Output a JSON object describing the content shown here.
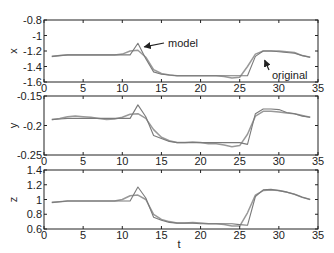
{
  "chart_data": [
    {
      "type": "line",
      "title": "",
      "xlabel": "",
      "ylabel": "x",
      "xlim": [
        0,
        35
      ],
      "ylim": [
        -1.6,
        -0.8
      ],
      "xticks": [
        0,
        5,
        10,
        15,
        20,
        25,
        30,
        35
      ],
      "yticks": [
        -0.8,
        -1,
        -1.2,
        -1.4,
        -1.6
      ],
      "ytick_labels": [
        "-0.8",
        "-1",
        "-1.2",
        "-1.4",
        "-1.6"
      ],
      "grid": false,
      "annotations": [
        {
          "text": "model",
          "arrow_to": [
            12.3,
            -1.12
          ],
          "text_pos": [
            16.5,
            -1.1
          ]
        },
        {
          "text": "original",
          "arrow_to": [
            27.8,
            -1.28
          ],
          "text_pos": [
            29.5,
            -1.52
          ]
        }
      ],
      "series": [
        {
          "name": "original",
          "x": [
            1,
            2,
            3,
            4,
            5,
            6,
            7,
            8,
            9,
            10,
            11,
            12,
            13,
            14,
            15,
            16,
            17,
            18,
            19,
            20,
            21,
            22,
            23,
            24,
            25,
            26,
            27,
            28,
            29,
            30,
            31,
            32,
            33,
            34
          ],
          "y": [
            -1.27,
            -1.26,
            -1.25,
            -1.25,
            -1.25,
            -1.25,
            -1.25,
            -1.25,
            -1.25,
            -1.24,
            -1.2,
            -1.19,
            -1.28,
            -1.44,
            -1.49,
            -1.51,
            -1.52,
            -1.52,
            -1.52,
            -1.52,
            -1.52,
            -1.52,
            -1.53,
            -1.55,
            -1.54,
            -1.4,
            -1.24,
            -1.2,
            -1.2,
            -1.2,
            -1.21,
            -1.22,
            -1.26,
            -1.28
          ]
        },
        {
          "name": "model",
          "x": [
            1,
            2,
            3,
            4,
            5,
            6,
            7,
            8,
            9,
            10,
            11,
            12,
            13,
            14,
            15,
            16,
            17,
            18,
            19,
            20,
            21,
            22,
            23,
            24,
            25,
            26,
            27,
            28,
            29,
            30,
            31,
            32,
            33,
            34
          ],
          "y": [
            -1.27,
            -1.26,
            -1.25,
            -1.25,
            -1.25,
            -1.25,
            -1.25,
            -1.25,
            -1.25,
            -1.25,
            -1.25,
            -1.1,
            -1.3,
            -1.47,
            -1.5,
            -1.51,
            -1.52,
            -1.52,
            -1.52,
            -1.52,
            -1.52,
            -1.52,
            -1.52,
            -1.52,
            -1.52,
            -1.52,
            -1.27,
            -1.2,
            -1.2,
            -1.21,
            -1.22,
            -1.23,
            -1.26,
            -1.28
          ]
        }
      ]
    },
    {
      "type": "line",
      "title": "",
      "xlabel": "",
      "ylabel": "y",
      "xlim": [
        0,
        35
      ],
      "ylim": [
        -0.25,
        -0.15
      ],
      "xticks": [
        0,
        5,
        10,
        15,
        20,
        25,
        30,
        35
      ],
      "yticks": [
        -0.15,
        -0.2,
        -0.25
      ],
      "ytick_labels": [
        "-0.15",
        "-0.2",
        "-0.25"
      ],
      "grid": false,
      "series": [
        {
          "name": "original",
          "x": [
            1,
            2,
            3,
            4,
            5,
            6,
            7,
            8,
            9,
            10,
            11,
            12,
            13,
            14,
            15,
            16,
            17,
            18,
            19,
            20,
            21,
            22,
            23,
            24,
            25,
            26,
            27,
            28,
            29,
            30,
            31,
            32,
            33,
            34
          ],
          "y": [
            -0.19,
            -0.188,
            -0.185,
            -0.184,
            -0.185,
            -0.186,
            -0.188,
            -0.19,
            -0.189,
            -0.186,
            -0.181,
            -0.18,
            -0.188,
            -0.207,
            -0.22,
            -0.226,
            -0.229,
            -0.229,
            -0.228,
            -0.229,
            -0.231,
            -0.231,
            -0.233,
            -0.236,
            -0.234,
            -0.215,
            -0.184,
            -0.176,
            -0.176,
            -0.177,
            -0.179,
            -0.18,
            -0.183,
            -0.186
          ]
        },
        {
          "name": "model",
          "x": [
            1,
            2,
            3,
            4,
            5,
            6,
            7,
            8,
            9,
            10,
            11,
            12,
            13,
            14,
            15,
            16,
            17,
            18,
            19,
            20,
            21,
            22,
            23,
            24,
            25,
            26,
            27,
            28,
            29,
            30,
            31,
            32,
            33,
            34
          ],
          "y": [
            -0.19,
            -0.189,
            -0.188,
            -0.188,
            -0.188,
            -0.188,
            -0.188,
            -0.188,
            -0.188,
            -0.188,
            -0.188,
            -0.165,
            -0.185,
            -0.217,
            -0.222,
            -0.227,
            -0.229,
            -0.229,
            -0.229,
            -0.229,
            -0.229,
            -0.229,
            -0.229,
            -0.229,
            -0.229,
            -0.232,
            -0.18,
            -0.172,
            -0.172,
            -0.173,
            -0.178,
            -0.18,
            -0.184,
            -0.186
          ]
        }
      ]
    },
    {
      "type": "line",
      "title": "",
      "xlabel": "t",
      "ylabel": "z",
      "xlim": [
        0,
        35
      ],
      "ylim": [
        0.6,
        1.4
      ],
      "xticks": [
        0,
        5,
        10,
        15,
        20,
        25,
        30,
        35
      ],
      "yticks": [
        1.4,
        1.2,
        1,
        0.8,
        0.6
      ],
      "ytick_labels": [
        "1.4",
        "1.2",
        "1",
        "0.8",
        "0.6"
      ],
      "grid": false,
      "series": [
        {
          "name": "original",
          "x": [
            1,
            2,
            3,
            4,
            5,
            6,
            7,
            8,
            9,
            10,
            11,
            12,
            13,
            14,
            15,
            16,
            17,
            18,
            19,
            20,
            21,
            22,
            23,
            24,
            25,
            26,
            27,
            28,
            29,
            30,
            31,
            32,
            33,
            34
          ],
          "y": [
            0.96,
            0.97,
            0.98,
            0.98,
            0.98,
            0.98,
            0.98,
            0.98,
            0.98,
            1.0,
            1.05,
            1.06,
            1.0,
            0.8,
            0.73,
            0.7,
            0.68,
            0.68,
            0.69,
            0.68,
            0.67,
            0.67,
            0.66,
            0.64,
            0.64,
            0.82,
            1.06,
            1.12,
            1.13,
            1.12,
            1.1,
            1.07,
            1.03,
            1.0
          ]
        },
        {
          "name": "model",
          "x": [
            1,
            2,
            3,
            4,
            5,
            6,
            7,
            8,
            9,
            10,
            11,
            12,
            13,
            14,
            15,
            16,
            17,
            18,
            19,
            20,
            21,
            22,
            23,
            24,
            25,
            26,
            27,
            28,
            29,
            30,
            31,
            32,
            33,
            34
          ],
          "y": [
            0.96,
            0.97,
            0.98,
            0.98,
            0.98,
            0.98,
            0.98,
            0.98,
            0.98,
            0.98,
            0.98,
            1.17,
            1.02,
            0.76,
            0.72,
            0.69,
            0.68,
            0.68,
            0.68,
            0.67,
            0.67,
            0.67,
            0.67,
            0.67,
            0.66,
            0.65,
            1.04,
            1.13,
            1.14,
            1.12,
            1.1,
            1.07,
            1.03,
            1.0
          ]
        }
      ]
    }
  ],
  "panels": [
    {
      "ylabel": "x"
    },
    {
      "ylabel": "y"
    },
    {
      "ylabel": "z",
      "xlabel": "t"
    }
  ],
  "labels": {
    "model": "model",
    "original": "original",
    "t": "t"
  },
  "colors": {
    "axes": "#222222",
    "original": "#999999",
    "model": "#7a7a7a"
  }
}
